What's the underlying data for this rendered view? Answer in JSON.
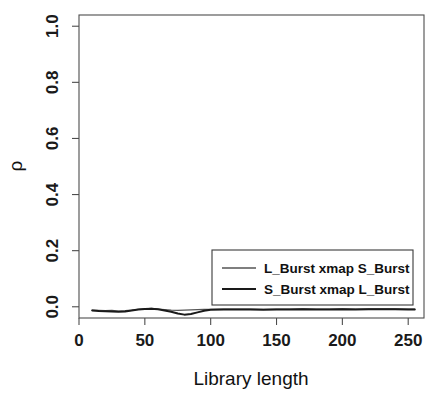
{
  "chart_data": {
    "type": "line",
    "title": "",
    "subtitle": "",
    "xlabel": "Library length",
    "ylabel": "ρ",
    "xlim": [
      0,
      262
    ],
    "ylim": [
      -0.04,
      1.04
    ],
    "grid": false,
    "legend_position": "bottom-right",
    "x_ticks": [
      0,
      50,
      100,
      150,
      200,
      250
    ],
    "x_tick_labels": [
      "0",
      "50",
      "100",
      "150",
      "200",
      "250"
    ],
    "y_ticks": [
      0.0,
      0.2,
      0.4,
      0.6,
      0.8,
      1.0
    ],
    "y_tick_labels": [
      "0.0",
      "0.2",
      "0.4",
      "0.6",
      "0.8",
      "1.0"
    ],
    "series": [
      {
        "name": "L_Burst xmap S_Burst",
        "color": "#555555",
        "linewidth": 1.2,
        "x": [
          10,
          15,
          20,
          25,
          30,
          35,
          40,
          45,
          50,
          55,
          60,
          65,
          70,
          75,
          80,
          85,
          90,
          95,
          100,
          110,
          120,
          130,
          140,
          150,
          160,
          170,
          180,
          190,
          200,
          210,
          220,
          230,
          240,
          250,
          255
        ],
        "y": [
          -0.012,
          -0.013,
          -0.014,
          -0.013,
          -0.015,
          -0.014,
          -0.012,
          -0.009,
          -0.007,
          -0.006,
          -0.008,
          -0.01,
          -0.012,
          -0.013,
          -0.012,
          -0.011,
          -0.01,
          -0.009,
          -0.009,
          -0.008,
          -0.008,
          -0.008,
          -0.009,
          -0.008,
          -0.008,
          -0.007,
          -0.008,
          -0.008,
          -0.007,
          -0.008,
          -0.007,
          -0.007,
          -0.007,
          -0.008,
          -0.008
        ]
      },
      {
        "name": "S_Burst xmap L_Burst",
        "color": "#1a1a1a",
        "linewidth": 2.0,
        "x": [
          10,
          15,
          20,
          25,
          30,
          35,
          40,
          45,
          50,
          55,
          60,
          65,
          70,
          75,
          80,
          85,
          90,
          95,
          100,
          110,
          120,
          130,
          140,
          150,
          160,
          170,
          180,
          190,
          200,
          210,
          220,
          230,
          240,
          250,
          255
        ],
        "y": [
          -0.013,
          -0.015,
          -0.016,
          -0.017,
          -0.018,
          -0.017,
          -0.013,
          -0.01,
          -0.008,
          -0.007,
          -0.009,
          -0.013,
          -0.018,
          -0.024,
          -0.028,
          -0.026,
          -0.02,
          -0.014,
          -0.011,
          -0.01,
          -0.01,
          -0.01,
          -0.011,
          -0.01,
          -0.01,
          -0.009,
          -0.01,
          -0.01,
          -0.009,
          -0.01,
          -0.009,
          -0.009,
          -0.009,
          -0.01,
          -0.01
        ]
      }
    ],
    "legend": [
      {
        "label": "L_Burst xmap S_Burst",
        "color": "#555555"
      },
      {
        "label": "S_Burst xmap L_Burst",
        "color": "#1a1a1a"
      }
    ]
  },
  "axes": {
    "y_label": "ρ",
    "x_label": "Library length"
  },
  "colors": {
    "background": "#ffffff",
    "frame": "#4d4d4d",
    "series_1": "#555555",
    "series_2": "#1a1a1a",
    "text": "#111111"
  }
}
